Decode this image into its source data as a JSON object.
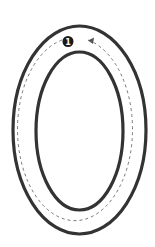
{
  "diagram": {
    "colors": {
      "background": "#ffffff",
      "track_border": "#333333",
      "path_dashed": "#777777",
      "badge_fill": "#1a1a1a",
      "badge_text": "#ffffff"
    },
    "start_marker": {
      "label": "1"
    },
    "direction": "counterclockwise"
  }
}
